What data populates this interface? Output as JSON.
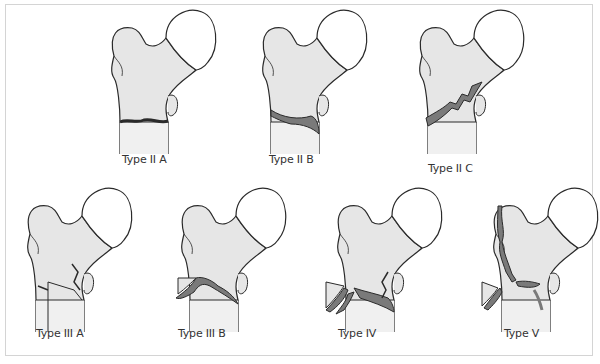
{
  "figure": {
    "colors": {
      "bone_fill": "#e6e6e6",
      "head_fill": "#ffffff",
      "outline": "#2a2a2a",
      "fracture": "#7a7a7a",
      "frame": "#d4d4d4"
    },
    "panels": [
      {
        "id": "type-2a",
        "label": "Type II A"
      },
      {
        "id": "type-2b",
        "label": "Type II B"
      },
      {
        "id": "type-2c",
        "label": "Type II C"
      },
      {
        "id": "type-3a",
        "label": "Type III A"
      },
      {
        "id": "type-3b",
        "label": "Type III B"
      },
      {
        "id": "type-4",
        "label": "Type IV"
      },
      {
        "id": "type-5",
        "label": "Type V"
      }
    ]
  }
}
